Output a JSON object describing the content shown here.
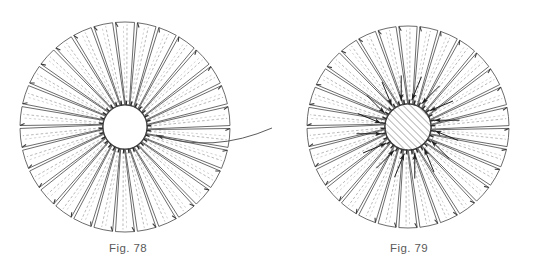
{
  "sheet": {
    "background_color": "#ffffff",
    "width": 547,
    "height": 274,
    "ink_color": "#3b3b3b",
    "dashed_color": "#9a9a9a",
    "caption_color": "#5a5a5a"
  },
  "figures": [
    {
      "id": "fig-78",
      "caption": "Fig. 78",
      "caption_x": 128,
      "caption_y": 252,
      "center_x": 125,
      "center_y": 127,
      "outer_radius": 105,
      "hub_radius": 22,
      "hub_fill": "none",
      "hub_style": "open",
      "blade_count": 30,
      "blade_half_angle": 5.2,
      "blade_twist": 6.0,
      "has_inward_arrows": false,
      "arrow_count": 0,
      "has_leader": true,
      "leader": {
        "tip_x": 156,
        "tip_y": 135,
        "mid_x": 212,
        "mid_y": 148,
        "end_x": 272,
        "end_y": 128,
        "arrowhead": "left"
      },
      "hub_tick_count": 30
    },
    {
      "id": "fig-79",
      "caption": "Fig. 79",
      "caption_x": 409,
      "caption_y": 252,
      "center_x": 408,
      "center_y": 127,
      "outer_radius": 101,
      "hub_radius": 23,
      "hub_fill": "hatch",
      "hub_style": "hatched",
      "blade_count": 30,
      "blade_half_angle": 5.2,
      "blade_twist": 6.0,
      "has_inward_arrows": true,
      "arrow_count": 16,
      "arrow_start_radius": 52,
      "arrow_end_radius": 27,
      "has_leader": false,
      "hub_tick_count": 30
    }
  ],
  "labels": {
    "sheet_title": "Patent drawing sheet",
    "fig_78_label": "Fig. 78",
    "fig_79_label": "Fig. 79"
  }
}
